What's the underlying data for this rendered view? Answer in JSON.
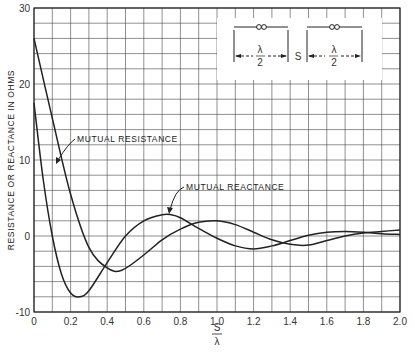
{
  "chart_data": {
    "type": "line",
    "title": "",
    "xlabel": "S/λ",
    "xlabel_num": "S",
    "xlabel_den": "λ",
    "ylabel": "RESISTANCE OR REACTANCE IN OHMS",
    "xlim": [
      0,
      2.0
    ],
    "ylim": [
      -10,
      30
    ],
    "grid": true,
    "x_ticks": [
      "0",
      "0.2",
      "0.4",
      "0.6",
      "0.8",
      "1.0",
      "1.2",
      "1.4",
      "1.6",
      "1.8",
      "2.0"
    ],
    "y_ticks": [
      "-10",
      "0",
      "10",
      "20",
      "30"
    ],
    "series": [
      {
        "name": "MUTUAL RESISTANCE",
        "x": [
          0,
          0.1,
          0.2,
          0.3,
          0.4,
          0.48,
          0.6,
          0.7,
          0.8,
          0.9,
          1.0,
          1.1,
          1.2,
          1.3,
          1.4,
          1.5,
          1.6,
          1.7,
          1.8,
          1.9,
          2.0
        ],
        "values": [
          26,
          15.5,
          5.5,
          -1.5,
          -4.2,
          -4.5,
          -2.5,
          -0.5,
          0.9,
          1.8,
          2.0,
          1.5,
          0.5,
          -0.5,
          -1.1,
          -1.2,
          -0.6,
          0.0,
          0.4,
          0.6,
          0.8
        ]
      },
      {
        "name": "MUTUAL REACTANCE",
        "x": [
          0,
          0.05,
          0.1,
          0.15,
          0.2,
          0.25,
          0.3,
          0.4,
          0.5,
          0.6,
          0.7,
          0.75,
          0.8,
          0.9,
          1.0,
          1.1,
          1.2,
          1.3,
          1.4,
          1.5,
          1.6,
          1.7,
          1.8,
          1.9,
          2.0
        ],
        "values": [
          17.5,
          7.5,
          0.0,
          -5.0,
          -7.5,
          -8.0,
          -7.2,
          -3.5,
          0.0,
          2.0,
          2.8,
          2.8,
          2.4,
          1.0,
          -0.3,
          -1.3,
          -1.7,
          -1.3,
          -0.6,
          0.1,
          0.5,
          0.6,
          0.5,
          0.3,
          0.2
        ]
      }
    ],
    "annotations": [
      {
        "text": "MUTUAL RESISTANCE",
        "x": 0.2,
        "y": 17
      },
      {
        "text": "MUTUAL REACTANCE",
        "x": 0.8,
        "y": 4.8
      }
    ],
    "inset": {
      "description": "Two parallel half-wave dipoles separated by S",
      "left_label_num": "λ",
      "left_label_den": "2",
      "spacing_label": "S",
      "right_label_num": "λ",
      "right_label_den": "2"
    },
    "legend_position": "none"
  },
  "colors": {
    "line": "#222222",
    "grid": "#333333",
    "background": "#ffffff"
  }
}
